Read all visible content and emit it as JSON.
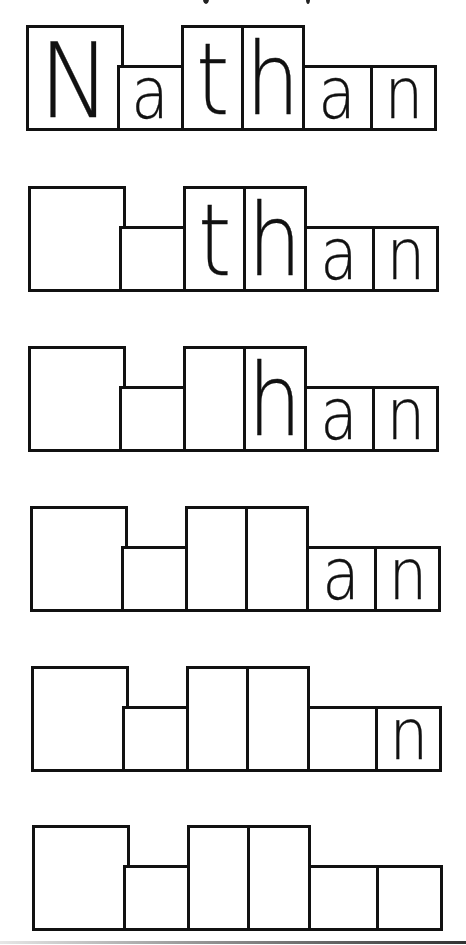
{
  "worksheet": {
    "name": "Nathan",
    "letters": [
      "N",
      "a",
      "t",
      "h",
      "a",
      "n"
    ],
    "letter_heights": [
      "cap",
      "short",
      "tall",
      "tall",
      "short",
      "short"
    ],
    "rows": [
      {
        "visible": [
          "N",
          "a",
          "t",
          "h",
          "a",
          "n"
        ]
      },
      {
        "visible": [
          "",
          "",
          "t",
          "h",
          "a",
          "n"
        ]
      },
      {
        "visible": [
          "",
          "",
          "",
          "h",
          "a",
          "n"
        ]
      },
      {
        "visible": [
          "",
          "",
          "",
          "",
          "a",
          "n"
        ]
      },
      {
        "visible": [
          "",
          "",
          "",
          "",
          "",
          "n"
        ]
      },
      {
        "visible": [
          "",
          "",
          "",
          "",
          "",
          ""
        ]
      }
    ]
  },
  "colors": {
    "ink": "#111111",
    "background": "#ffffff"
  }
}
